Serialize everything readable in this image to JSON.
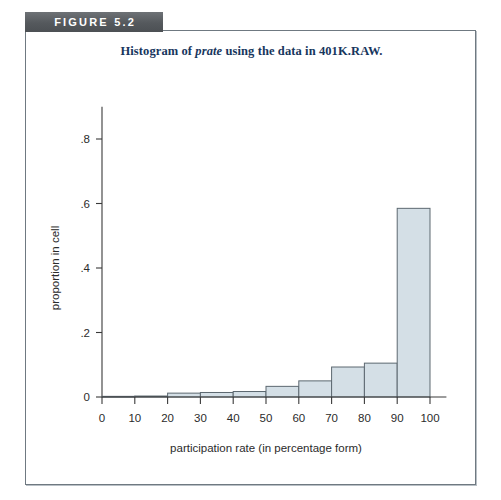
{
  "figure": {
    "tab_label": "FIGURE 5.2",
    "title_prefix": "Histogram of ",
    "title_italic": "prate",
    "title_suffix": " using the data in 401K.RAW.",
    "tab_color": "#5b5f63",
    "title_color": "#17365d",
    "frame_border_color": "#6f7981"
  },
  "chart_data": {
    "type": "bar",
    "title": "Histogram of prate using the data in 401K.RAW.",
    "xlabel": "participation rate (in percentage form)",
    "ylabel": "proportion in cell",
    "xlim": [
      0,
      105
    ],
    "ylim": [
      0,
      0.9
    ],
    "grid": false,
    "legend": "none",
    "bar_fill": "#d4dfe6",
    "bar_stroke": "#5c6870",
    "bin_width": 10,
    "xticks": [
      0,
      10,
      20,
      30,
      40,
      50,
      60,
      70,
      80,
      90,
      100
    ],
    "xtick_labels": [
      "0",
      "10",
      "20",
      "30",
      "40",
      "50",
      "60",
      "70",
      "80",
      "90",
      "100"
    ],
    "yticks": [
      0,
      0.2,
      0.4,
      0.6,
      0.8
    ],
    "ytick_labels": [
      "0",
      ".2",
      ".4",
      ".6",
      ".8"
    ],
    "bin_starts": [
      0,
      10,
      20,
      30,
      40,
      50,
      60,
      70,
      80,
      90
    ],
    "bin_ends": [
      10,
      20,
      30,
      40,
      50,
      60,
      70,
      80,
      90,
      100
    ],
    "categories": [
      "0-10",
      "10-20",
      "20-30",
      "30-40",
      "40-50",
      "50-60",
      "60-70",
      "70-80",
      "80-90",
      "90-100"
    ],
    "values": [
      0.002,
      0.003,
      0.012,
      0.014,
      0.017,
      0.033,
      0.05,
      0.093,
      0.105,
      0.585
    ]
  }
}
